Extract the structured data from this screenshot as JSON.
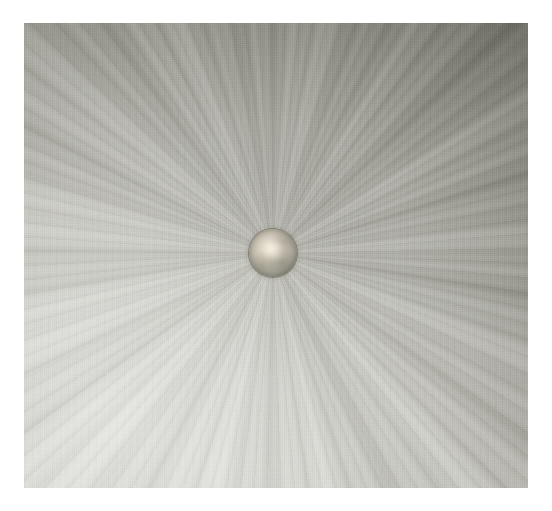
{
  "artwork": {
    "subject": "radial-burst-painting",
    "medium_appearance": "oil-on-canvas",
    "orientation": "landscape",
    "background_color": "#ffffff",
    "canvas": {
      "left": 24,
      "top": 23,
      "width": 504,
      "height": 465,
      "base_color": "#a9a9a1"
    },
    "composition": {
      "focal_point": {
        "x": 273,
        "y": 253
      },
      "focal_point_relative": {
        "x_pct": 49.4,
        "y_pct": 49.5
      },
      "pattern": "radial zoom-blur streaks converging on a central sphere",
      "light_direction": "lower-left lighter, upper-right darker"
    },
    "center_orb": {
      "name": "central-sphere",
      "center_x": 273,
      "center_y": 253,
      "diameter": 48,
      "rim_color": "#6a6a60",
      "core_color": "#e6e0d2",
      "midtone_color": "#a9a79a",
      "highlight_color": "#fffcf0"
    },
    "palette": {
      "darkest": "#7e7e74",
      "dark_mid": "#8c8c82",
      "mid": "#a9a9a1",
      "light_mid": "#c6c6be",
      "light": "#d8d8d2",
      "lightest": "#e2e2dc",
      "streak_shadow": "#6e6e62",
      "streak_highlight": "#eeeee8",
      "white_surround": "#ffffff"
    },
    "regions": [
      {
        "name": "top-left",
        "tone": "mid-light",
        "avg_color": "#b6b6ae"
      },
      {
        "name": "top-center",
        "tone": "light-mid",
        "avg_color": "#c0c0b8"
      },
      {
        "name": "top-right",
        "tone": "dark",
        "avg_color": "#85857b"
      },
      {
        "name": "left-middle",
        "tone": "mid",
        "avg_color": "#a8a8a0"
      },
      {
        "name": "right-middle",
        "tone": "mid-dark",
        "avg_color": "#97978d"
      },
      {
        "name": "bottom-left",
        "tone": "lightest",
        "avg_color": "#d8d8d2"
      },
      {
        "name": "bottom-center",
        "tone": "light",
        "avg_color": "#d0d0c9"
      },
      {
        "name": "bottom-right",
        "tone": "mid-light",
        "avg_color": "#bdbdb5"
      }
    ],
    "texture": {
      "canvas_weave": "visible fine linen grain",
      "brush_marks": "long radial drag strokes"
    }
  }
}
